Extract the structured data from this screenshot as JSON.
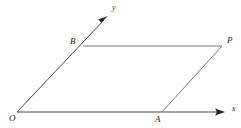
{
  "figure": {
    "type": "geometry-diagram",
    "background_color": "#ffffff",
    "stroke_color": "#333333",
    "text_color": "#1a1a1a",
    "labels": {
      "origin": "O",
      "vertex_a": "A",
      "vertex_b": "B",
      "vertex_p": "P",
      "axis_x": "x",
      "axis_y": "y"
    },
    "points": {
      "O": {
        "x": 17,
        "y": 112
      },
      "A": {
        "x": 162,
        "y": 112
      },
      "B": {
        "x": 83,
        "y": 46
      },
      "P": {
        "x": 222,
        "y": 46
      },
      "x_arrow_tip": {
        "x": 225,
        "y": 112
      },
      "y_arrow_tip": {
        "x": 108,
        "y": 16
      }
    },
    "segments": [
      {
        "name": "x-axis",
        "from": "O",
        "to": "x_arrow_tip",
        "arrow": true
      },
      {
        "name": "y-axis",
        "from": "O",
        "to": "y_arrow_tip",
        "arrow": true
      },
      {
        "name": "side-BP",
        "from": "B",
        "to": "P",
        "arrow": false
      },
      {
        "name": "side-AP",
        "from": "A",
        "to": "P",
        "arrow": false
      }
    ]
  }
}
